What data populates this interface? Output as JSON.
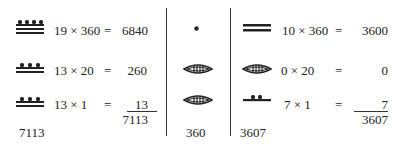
{
  "left": {
    "rows": [
      {
        "glyph": "bar-with-4-dots",
        "expr": "19 × 360",
        "eq": "=",
        "value": "6840"
      },
      {
        "glyph": "bar-with-3-dots-a",
        "expr": "13 × 20",
        "eq": "=",
        "value": "260"
      },
      {
        "glyph": "bar-with-3-dots-b",
        "expr": "13 × 1",
        "eq": "=",
        "value": "13"
      }
    ],
    "sum": "7113",
    "total": "7113"
  },
  "middle": {
    "glyphs": [
      "dot",
      "shell",
      "shell"
    ],
    "total": "360"
  },
  "right": {
    "rows": [
      {
        "glyph": "two-bars",
        "expr": "10 × 360",
        "eq": "=",
        "value": "3600"
      },
      {
        "glyph": "shell",
        "expr": "0 × 20",
        "eq": "=",
        "value": "0"
      },
      {
        "glyph": "bar-with-2-dots",
        "expr": "7 × 1",
        "eq": "=",
        "value": "7"
      }
    ],
    "sum": "3607",
    "total": "3607"
  },
  "colors": {
    "ink": "#222222",
    "background": "#ffffff"
  }
}
